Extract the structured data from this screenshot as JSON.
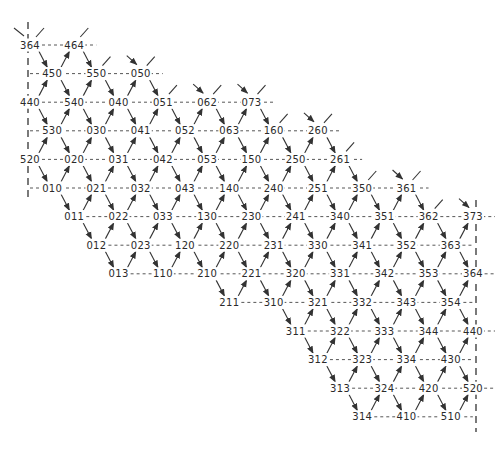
{
  "diagram": {
    "header_clipped_text": "",
    "rows": [
      {
        "offset": "full",
        "start": 0,
        "labels": [
          "364",
          "464"
        ]
      },
      {
        "offset": "half",
        "start": 0,
        "labels": [
          "450",
          "550",
          "050"
        ]
      },
      {
        "offset": "full",
        "start": 0,
        "labels": [
          "440",
          "540",
          "040",
          "051",
          "062",
          "073"
        ]
      },
      {
        "offset": "half",
        "start": 0,
        "labels": [
          "530",
          "030",
          "041",
          "052",
          "063",
          "160",
          "260"
        ]
      },
      {
        "offset": "full",
        "start": 0,
        "labels": [
          "520",
          "020",
          "031",
          "042",
          "053",
          "150",
          "250",
          "261"
        ]
      },
      {
        "offset": "half",
        "start": 0,
        "labels": [
          "010",
          "021",
          "032",
          "043",
          "140",
          "240",
          "251",
          "350",
          "361"
        ]
      },
      {
        "offset": "full",
        "start": 1,
        "labels": [
          "011",
          "022",
          "033",
          "130",
          "230",
          "241",
          "340",
          "351",
          "362",
          "373"
        ]
      },
      {
        "offset": "half",
        "start": 1,
        "labels": [
          "012",
          "023",
          "120",
          "220",
          "231",
          "330",
          "341",
          "352",
          "363"
        ]
      },
      {
        "offset": "full",
        "start": 2,
        "labels": [
          "013",
          "110",
          "210",
          "221",
          "320",
          "331",
          "342",
          "353",
          "364"
        ]
      },
      {
        "offset": "half",
        "start": 4,
        "labels": [
          "211",
          "310",
          "321",
          "332",
          "343",
          "354"
        ]
      },
      {
        "offset": "full",
        "start": 6,
        "labels": [
          "311",
          "322",
          "333",
          "344",
          "440"
        ]
      },
      {
        "offset": "half",
        "start": 6,
        "labels": [
          "312",
          "323",
          "334",
          "430"
        ]
      },
      {
        "offset": "full",
        "start": 7,
        "labels": [
          "313",
          "324",
          "420",
          "520"
        ]
      },
      {
        "offset": "half",
        "start": 7,
        "labels": [
          "314",
          "410",
          "510"
        ]
      }
    ],
    "edge_style": "arrows point rightward along diagonals; dashed horizontal links between labels in a row",
    "boundaries": [
      "left dashed vertical boundary",
      "right dashed vertical boundary"
    ]
  }
}
